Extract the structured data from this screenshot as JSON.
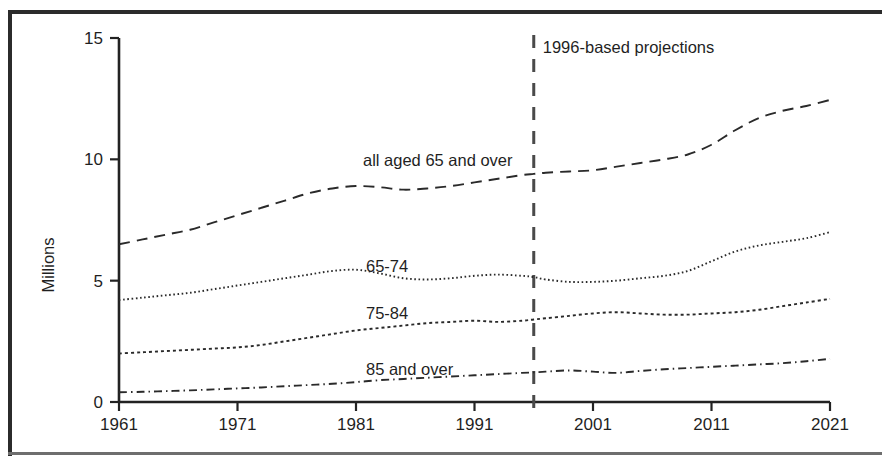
{
  "figure": {
    "axis": {
      "ylabel": "Millions",
      "yticks": [
        "0",
        "5",
        "10",
        "15"
      ],
      "xticks": [
        "1961",
        "1971",
        "1981",
        "1991",
        "2001",
        "2011",
        "2021"
      ]
    },
    "annotation": {
      "projection_note": "1996-based projections",
      "projection_year": 1996
    },
    "series_labels": {
      "all65": "all aged 65 and over",
      "a6574": "65-74",
      "a7584": "75-84",
      "a85": "85 and over"
    },
    "colors": {
      "ink": "#2a2a2a",
      "frame": "#2b2b2b",
      "background": "#ffffff",
      "projection_rule": "#4a4a4a"
    }
  },
  "chart_data": {
    "type": "line",
    "title": "",
    "subtitle": "",
    "xlabel": "",
    "ylabel": "Millions",
    "xlim": [
      1961,
      2021
    ],
    "ylim": [
      0,
      15
    ],
    "grid": false,
    "legend": "inline-labels",
    "annotations": [
      {
        "text": "1996-based projections",
        "x": 1996,
        "type": "vertical-rule-label"
      }
    ],
    "x": [
      1961,
      1963,
      1965,
      1967,
      1969,
      1971,
      1973,
      1975,
      1977,
      1979,
      1981,
      1983,
      1985,
      1987,
      1989,
      1991,
      1993,
      1995,
      1996,
      1997,
      1999,
      2001,
      2003,
      2005,
      2007,
      2009,
      2011,
      2013,
      2015,
      2017,
      2019,
      2021
    ],
    "series": [
      {
        "name": "all aged 65 and over",
        "style": "long-dash",
        "values": [
          6.5,
          6.7,
          6.9,
          7.1,
          7.4,
          7.7,
          8.0,
          8.3,
          8.6,
          8.8,
          8.9,
          8.85,
          8.75,
          8.8,
          8.9,
          9.05,
          9.2,
          9.35,
          9.4,
          9.45,
          9.5,
          9.55,
          9.7,
          9.85,
          10.0,
          10.2,
          10.6,
          11.2,
          11.7,
          12.0,
          12.2,
          12.45
        ]
      },
      {
        "name": "65-74",
        "style": "fine-dot",
        "values": [
          4.2,
          4.3,
          4.4,
          4.5,
          4.65,
          4.8,
          4.95,
          5.1,
          5.25,
          5.4,
          5.45,
          5.3,
          5.1,
          5.05,
          5.1,
          5.2,
          5.25,
          5.2,
          5.15,
          5.05,
          4.95,
          4.95,
          5.0,
          5.1,
          5.2,
          5.4,
          5.8,
          6.2,
          6.45,
          6.6,
          6.75,
          7.0
        ]
      },
      {
        "name": "75-84",
        "style": "medium-dot",
        "values": [
          2.0,
          2.05,
          2.1,
          2.15,
          2.2,
          2.25,
          2.35,
          2.5,
          2.65,
          2.8,
          2.95,
          3.05,
          3.15,
          3.25,
          3.3,
          3.35,
          3.3,
          3.35,
          3.4,
          3.45,
          3.55,
          3.65,
          3.7,
          3.65,
          3.6,
          3.6,
          3.65,
          3.7,
          3.8,
          3.95,
          4.1,
          4.25
        ]
      },
      {
        "name": "85 and over",
        "style": "dash-dot",
        "values": [
          0.4,
          0.42,
          0.45,
          0.48,
          0.52,
          0.56,
          0.6,
          0.65,
          0.7,
          0.75,
          0.82,
          0.9,
          0.95,
          1.0,
          1.05,
          1.1,
          1.15,
          1.2,
          1.22,
          1.25,
          1.3,
          1.25,
          1.2,
          1.28,
          1.35,
          1.4,
          1.45,
          1.5,
          1.55,
          1.6,
          1.68,
          1.78
        ]
      }
    ]
  }
}
